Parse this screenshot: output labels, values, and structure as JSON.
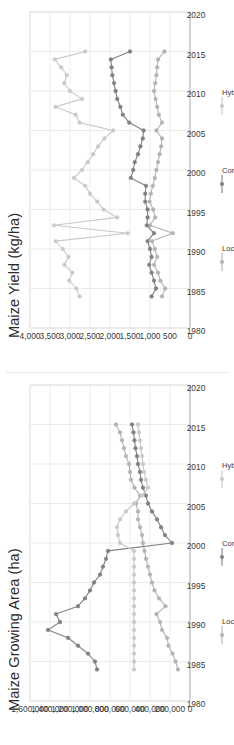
{
  "page": {
    "background": "#ffffff",
    "orientation": "charts rotated 90 degrees counter-clockwise"
  },
  "figure": {
    "panels": [
      "Maize Yield (kg/ha)",
      "Maize Growing Area (ha)"
    ]
  },
  "legend": {
    "series_names": [
      "Local",
      "Composite",
      "Hybrid"
    ],
    "colors": [
      "#b3b3b3",
      "#808080",
      "#c9c9c9"
    ]
  },
  "chart_data": [
    {
      "type": "line",
      "title": "Maize Yield (kg/ha)",
      "xlabel": "",
      "ylabel": "",
      "xlim": [
        1980,
        2020
      ],
      "ylim": [
        0,
        4000
      ],
      "xticks": [
        1980,
        1985,
        1990,
        1995,
        2000,
        2005,
        2010,
        2015,
        2020
      ],
      "yticks": [
        0,
        500,
        1000,
        1500,
        2000,
        2500,
        3000,
        3500,
        4000
      ],
      "ytick_labels": [
        "0",
        "500",
        "1,000",
        "1,500",
        "2,000",
        "2,500",
        "3,000",
        "3,500",
        "4,000"
      ],
      "xtick_labels": [
        "1980",
        "1985",
        "1990",
        "1995",
        "2000",
        "2005",
        "2010",
        "2015",
        "2020"
      ],
      "grid": true,
      "legend_position": "bottom",
      "x": [
        1984,
        1985,
        1986,
        1987,
        1988,
        1989,
        1990,
        1991,
        1992,
        1993,
        1994,
        1995,
        1996,
        1997,
        1998,
        1999,
        2000,
        2001,
        2002,
        2003,
        2004,
        2005,
        2006,
        2007,
        2008,
        2009,
        2010,
        2011,
        2012,
        2013,
        2014,
        2015
      ],
      "series": [
        {
          "name": "Local",
          "color": "#b3b3b3",
          "values": [
            700,
            620,
            740,
            800,
            900,
            820,
            880,
            950,
            430,
            1000,
            870,
            920,
            1010,
            980,
            930,
            880,
            840,
            800,
            760,
            720,
            700,
            840,
            700,
            780,
            820,
            860,
            900,
            870,
            840,
            820,
            800,
            640
          ]
        },
        {
          "name": "Composite",
          "color": "#808080",
          "values": [
            960,
            850,
            900,
            960,
            1020,
            960,
            1000,
            1060,
            900,
            1080,
            1060,
            1060,
            1120,
            1120,
            1100,
            1480,
            1420,
            1380,
            1300,
            1240,
            1180,
            1160,
            1520,
            1680,
            1740,
            1820,
            1860,
            1900,
            1940,
            1960,
            1980,
            1500
          ]
        },
        {
          "name": "Hybrid",
          "color": "#c9c9c9",
          "values": [
            2760,
            2840,
            3020,
            2940,
            3140,
            3040,
            3180,
            3360,
            1560,
            3400,
            1820,
            2160,
            2320,
            2500,
            2620,
            2900,
            2700,
            2560,
            2420,
            2300,
            2140,
            1920,
            2760,
            2860,
            3360,
            2700,
            3000,
            3140,
            3080,
            3220,
            3380,
            2620
          ]
        }
      ]
    },
    {
      "type": "line",
      "title": "Maize Growing Area (ha)",
      "xlabel": "",
      "ylabel": "",
      "xlim": [
        1980,
        2020
      ],
      "ylim": [
        0,
        1600000
      ],
      "xticks": [
        1980,
        1985,
        1990,
        1995,
        2000,
        2005,
        2010,
        2015,
        2020
      ],
      "yticks": [
        0,
        200000,
        400000,
        600000,
        800000,
        1000000,
        1200000,
        1400000,
        1600000
      ],
      "ytick_labels": [
        "0",
        "200,000",
        "400,000",
        "600,000",
        "800,000",
        "1,000,000",
        "1,200,000",
        "1,400,000",
        "1,600,000"
      ],
      "xtick_labels": [
        "1980",
        "1985",
        "1990",
        "1995",
        "2000",
        "2005",
        "2010",
        "2015",
        "2020"
      ],
      "grid": true,
      "legend_position": "bottom",
      "x": [
        1984,
        1985,
        1986,
        1987,
        1988,
        1989,
        1990,
        1991,
        1992,
        1993,
        1994,
        1995,
        1996,
        1997,
        1998,
        1999,
        2000,
        2001,
        2002,
        2003,
        2004,
        2005,
        2006,
        2007,
        2008,
        2009,
        2010,
        2011,
        2012,
        2013,
        2014,
        2015
      ],
      "series": [
        {
          "name": "Local",
          "color": "#b3b3b3",
          "values": [
            120000,
            145000,
            175000,
            215000,
            230000,
            280000,
            300000,
            335000,
            245000,
            310000,
            355000,
            380000,
            400000,
            420000,
            440000,
            455000,
            470000,
            480000,
            500000,
            520000,
            520000,
            540000,
            500000,
            555000,
            590000,
            600000,
            610000,
            640000,
            660000,
            680000,
            700000,
            740000
          ]
        },
        {
          "name": "Composite",
          "color": "#808080",
          "values": [
            930000,
            950000,
            1020000,
            1120000,
            1220000,
            1420000,
            1300000,
            1340000,
            1120000,
            1050000,
            1000000,
            960000,
            900000,
            870000,
            840000,
            820000,
            180000,
            250000,
            290000,
            330000,
            380000,
            420000,
            440000,
            470000,
            490000,
            500000,
            520000,
            530000,
            545000,
            555000,
            565000,
            580000
          ]
        },
        {
          "name": "Hybrid",
          "color": "#c9c9c9",
          "values": [
            560000,
            560000,
            560000,
            560000,
            560000,
            560000,
            560000,
            560000,
            560000,
            560000,
            560000,
            560000,
            560000,
            560000,
            560000,
            560000,
            700000,
            720000,
            730000,
            700000,
            640000,
            560000,
            480000,
            420000,
            440000,
            460000,
            470000,
            480000,
            490000,
            500000,
            510000,
            520000
          ]
        }
      ]
    }
  ]
}
